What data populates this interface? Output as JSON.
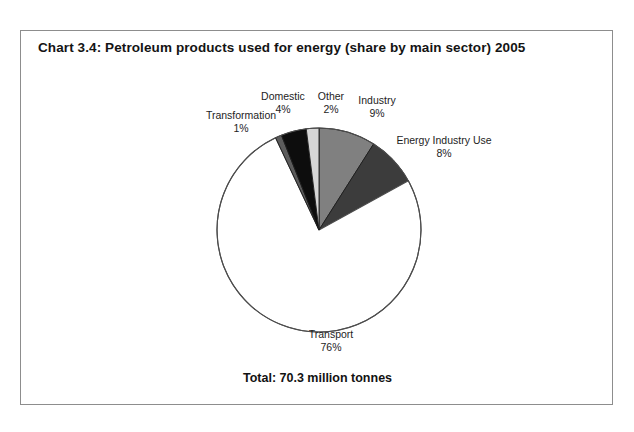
{
  "page": {
    "scan_artifact_text": "UK petroleum products used for energy by main sector",
    "background_color": "#ffffff",
    "frame_border_color": "#8d8d8d"
  },
  "chart_frame": {
    "title": "Chart 3.4:  Petroleum products used for energy (share by main sector) 2005",
    "total_note": "Total: 70.3 million tonnes"
  },
  "chart_data": {
    "type": "pie",
    "title": "Chart 3.4:  Petroleum products used for energy (share by main sector) 2005",
    "subtitle": "",
    "xlabel": "",
    "ylabel": "",
    "units": "million tonnes",
    "total": 70.3,
    "total_label": "Total: 70.3 million tonnes",
    "legend_position": "none",
    "grid": false,
    "start_angle_deg": 0,
    "direction": "clockwise",
    "categories": [
      "Industry",
      "Energy Industry Use",
      "Transport",
      "Transformation",
      "Domestic",
      "Other"
    ],
    "values": [
      9,
      8,
      76,
      1,
      4,
      2
    ],
    "value_unit": "percent",
    "slices": [
      {
        "label": "Industry",
        "percent": 9,
        "percent_text": "9%",
        "color": "#808080",
        "outline_color": "#1c1c1c"
      },
      {
        "label": "Energy Industry Use",
        "percent": 8,
        "percent_text": "8%",
        "color": "#3c3c3c",
        "outline_color": "#1c1c1c"
      },
      {
        "label": "Transport",
        "percent": 76,
        "percent_text": "76%",
        "color": "#ffffff",
        "outline_color": "#4d4d4d"
      },
      {
        "label": "Transformation",
        "percent": 1,
        "percent_text": "1%",
        "color": "#5c5c5c",
        "outline_color": "#1c1c1c"
      },
      {
        "label": "Domestic",
        "percent": 4,
        "percent_text": "4%",
        "color": "#0d0d0d",
        "outline_color": "#1c1c1c"
      },
      {
        "label": "Other",
        "percent": 2,
        "percent_text": "2%",
        "color": "#d6d6d6",
        "outline_color": "#1c1c1c"
      }
    ]
  }
}
